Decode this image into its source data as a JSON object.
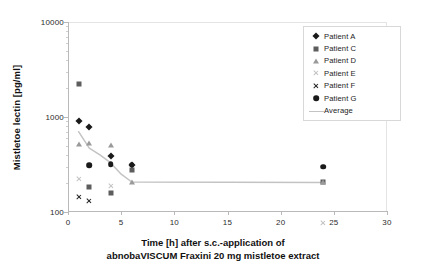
{
  "chart_data": {
    "type": "scatter",
    "title": "",
    "xlabel": "Time  [h] after s.c.-application of abnobaVISCUM Fraxini 20 mg mistletoe extract",
    "xlabel_line1": "Time  [h] after s.c.-application of",
    "xlabel_line2": "abnobaVISCUM Fraxini 20 mg mistletoe extract",
    "ylabel": "Mistletoe lectin [pg/ml]",
    "yscale": "log",
    "ylim": [
      100,
      10000
    ],
    "xlim": [
      0,
      30
    ],
    "yticks": [
      100,
      1000,
      10000
    ],
    "ytick_labels": [
      "100",
      "1000",
      "10000"
    ],
    "xticks": [
      0,
      5,
      10,
      15,
      20,
      25,
      30
    ],
    "xtick_labels": [
      "0",
      "5",
      "10",
      "15",
      "20",
      "25",
      "30"
    ],
    "grid": false,
    "legend_position": "upper right",
    "series": [
      {
        "name": "Patient A",
        "marker": "diamond",
        "color": "#1a1a1a",
        "points": [
          [
            1,
            900
          ],
          [
            2,
            780
          ],
          [
            4,
            390
          ],
          [
            6,
            310
          ]
        ]
      },
      {
        "name": "Patient C",
        "marker": "square",
        "color": "#5d5d5d",
        "points": [
          [
            1,
            2250
          ],
          [
            2,
            185
          ],
          [
            4,
            160
          ],
          [
            6,
            280
          ],
          [
            24,
            205
          ]
        ]
      },
      {
        "name": "Patient D",
        "marker": "triangle",
        "color": "#9a9a9a",
        "points": [
          [
            1,
            520
          ],
          [
            2,
            530
          ],
          [
            4,
            510
          ],
          [
            6,
            205
          ],
          [
            24,
            205
          ]
        ]
      },
      {
        "name": "Patient E",
        "marker": "star",
        "color": "#c2c2c2",
        "points": [
          [
            1,
            225
          ],
          [
            4,
            218
          ],
          [
            24,
            103
          ]
        ]
      },
      {
        "name": "Patient F",
        "marker": "x",
        "color": "#232323",
        "points": [
          [
            1,
            225
          ],
          [
            2,
            232
          ]
        ]
      },
      {
        "name": "Patient G",
        "marker": "circle",
        "color": "#1a1a1a",
        "points": [
          [
            2,
            310
          ],
          [
            4,
            320
          ],
          [
            6,
            315
          ],
          [
            24,
            300
          ]
        ]
      },
      {
        "name": "Average",
        "marker": "line",
        "color": "#c3c3c3",
        "points": [
          [
            1,
            700
          ],
          [
            2,
            470
          ],
          [
            3,
            400
          ],
          [
            4,
            330
          ],
          [
            5,
            250
          ],
          [
            6,
            207
          ],
          [
            24,
            205
          ]
        ]
      }
    ]
  },
  "legend": {
    "items": [
      {
        "label": "Patient A"
      },
      {
        "label": "Patient C"
      },
      {
        "label": "Patient D"
      },
      {
        "label": "Patient E"
      },
      {
        "label": "Patient F"
      },
      {
        "label": "Patient G"
      },
      {
        "label": "Average"
      }
    ]
  }
}
